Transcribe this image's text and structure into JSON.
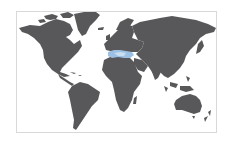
{
  "map": {
    "type": "world-map",
    "projection": "equirectangular-like",
    "colors": {
      "background": "#ffffff",
      "frame": "#d9d9d9",
      "land": "#58585a",
      "highlight": "#9cc0e2"
    },
    "highlighted_region": {
      "name": "Mediterranean",
      "color": "#9cc0e2"
    },
    "regions": [
      "North America",
      "Greenland",
      "South America",
      "Europe",
      "Africa",
      "Asia",
      "Australia",
      "New Zealand"
    ]
  }
}
